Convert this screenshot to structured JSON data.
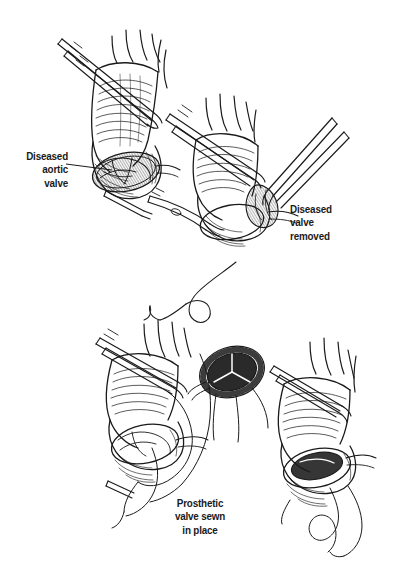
{
  "figure": {
    "background_color": "#ffffff",
    "ink_color": "#1a1a1a",
    "style": "pen-and-ink crosshatch medical illustration",
    "width": 401,
    "height": 577
  },
  "labels": {
    "diseased_aortic_valve": "Diseased\naortic\nvalve",
    "diseased_valve_removed": "Diseased\nvalve\nremoved",
    "prosthetic_valve_sewn": "Prosthetic\nvalve sewn\nin place"
  },
  "panels": [
    {
      "id": "panel-1",
      "name": "diseased-aortic-valve-exposed",
      "position": "top-left",
      "description": "Opened aortic root exposing the calcified diseased aortic valve, held by forceps"
    },
    {
      "id": "panel-2",
      "name": "valve-excision",
      "position": "top-right",
      "description": "Forceps and scissors excising the diseased valve leaflets with retractor in place"
    },
    {
      "id": "panel-3",
      "name": "suture-placement",
      "position": "bottom-left",
      "description": "Sutures placed through the annulus with trailing suture threads, prosthetic valve alongside"
    },
    {
      "id": "panel-4",
      "name": "prosthesis-seated",
      "position": "bottom-right",
      "description": "Prosthetic valve sewn into the annulus with suture tail trailing"
    }
  ],
  "prosthesis": {
    "name": "prosthetic-heart-valve",
    "leaflet_count": 3,
    "description": "Oval sewing-ring prosthesis with dark orifice and tri-leaflet pattern"
  }
}
